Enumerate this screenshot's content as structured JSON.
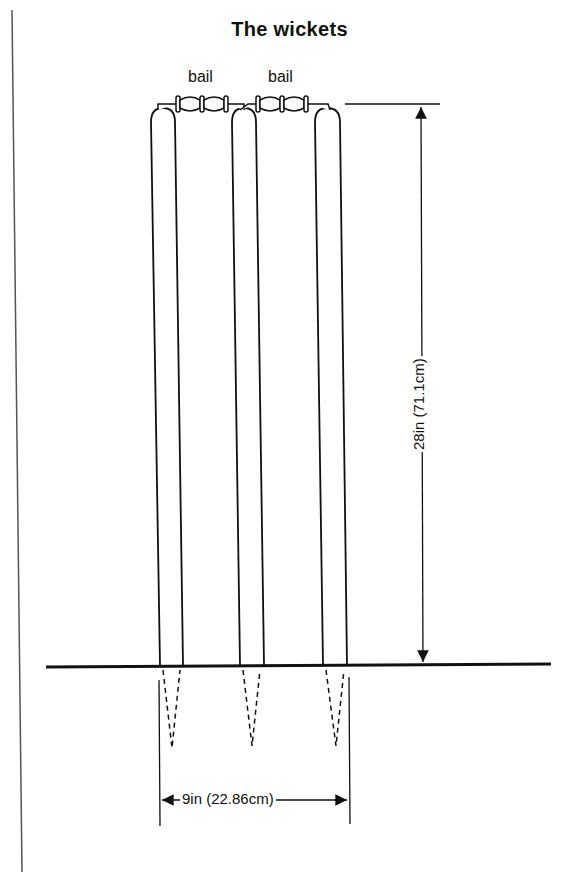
{
  "title": "The wickets",
  "labels": {
    "bail_left": "bail",
    "bail_right": "bail",
    "height_dimension": "28in (71.1cm)",
    "width_dimension": "9in (22.86cm)"
  },
  "colors": {
    "ink": "#111111",
    "background": "#ffffff"
  },
  "components": {
    "stumps": [
      "stump-1",
      "stump-2",
      "stump-3"
    ],
    "bails": [
      "bail-left",
      "bail-right"
    ],
    "ground_line": "ground",
    "margin_rule": "left-vertical-rule"
  }
}
